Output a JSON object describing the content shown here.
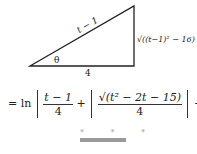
{
  "triangle": {
    "hypotenuse": "t − 1",
    "opposite": "√((t−1)² − 16)",
    "adjacent": "4",
    "angle": "θ"
  },
  "equation": {
    "prefix": "= ln",
    "frac1_num": "t − 1",
    "frac1_den": "4",
    "plus": "+",
    "frac2_num": "√(t² − 2t − 15)",
    "frac2_den": "4",
    "suffix": "+ C"
  },
  "separator": {
    "stars": "* * *"
  }
}
